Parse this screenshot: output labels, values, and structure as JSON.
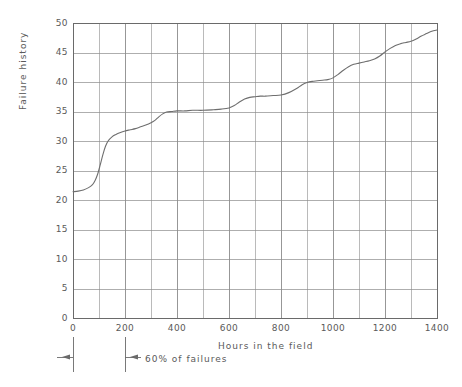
{
  "chart_data": {
    "type": "line",
    "title": "",
    "xlabel": "Hours in the field",
    "ylabel": "Failure history",
    "xlim": [
      0,
      1400
    ],
    "ylim": [
      0,
      50
    ],
    "xticks": [
      0,
      200,
      400,
      600,
      800,
      1000,
      1200,
      1400
    ],
    "yticks": [
      0,
      5,
      10,
      15,
      20,
      25,
      30,
      35,
      40,
      45,
      50
    ],
    "grid": true,
    "minor_grid_x_step": 100,
    "legend": null,
    "series": [
      {
        "name": "Failure history",
        "x": [
          0,
          20,
          40,
          60,
          75,
          85,
          95,
          105,
          115,
          125,
          135,
          150,
          165,
          180,
          200,
          220,
          240,
          260,
          280,
          300,
          315,
          330,
          345,
          360,
          380,
          400,
          430,
          460,
          500,
          540,
          570,
          600,
          620,
          640,
          660,
          680,
          700,
          720,
          740,
          770,
          800,
          830,
          860,
          880,
          900,
          920,
          940,
          960,
          980,
          1000,
          1020,
          1040,
          1060,
          1080,
          1100,
          1120,
          1140,
          1160,
          1180,
          1200,
          1220,
          1240,
          1260,
          1280,
          1300,
          1320,
          1340,
          1360,
          1380,
          1400
        ],
        "y": [
          21.4,
          21.5,
          21.7,
          22.1,
          22.6,
          23.3,
          24.4,
          26.0,
          27.7,
          29.1,
          30.0,
          30.7,
          31.1,
          31.4,
          31.7,
          31.9,
          32.1,
          32.4,
          32.7,
          33.1,
          33.5,
          34.1,
          34.6,
          34.9,
          35.0,
          35.1,
          35.1,
          35.2,
          35.2,
          35.3,
          35.4,
          35.6,
          36.0,
          36.6,
          37.1,
          37.4,
          37.5,
          37.6,
          37.6,
          37.7,
          37.8,
          38.2,
          38.9,
          39.5,
          39.9,
          40.1,
          40.2,
          40.3,
          40.4,
          40.7,
          41.3,
          42.0,
          42.6,
          43.0,
          43.2,
          43.4,
          43.6,
          43.9,
          44.4,
          45.1,
          45.7,
          46.2,
          46.5,
          46.7,
          46.9,
          47.3,
          47.8,
          48.2,
          48.6,
          48.8
        ],
        "color": "#6e6e6e"
      }
    ],
    "annotations": [
      {
        "name": "sixty-percent-of-failures",
        "text": "60% of failures",
        "x_from": 0,
        "x_to": 200,
        "style": "dimension-arrows-below-axis"
      }
    ],
    "colors": {
      "curve": "#6e6e6e",
      "grid": "#8c8c8c",
      "frame": "#6a6a6a",
      "text": "#5a5a5a",
      "background": "#ffffff"
    }
  }
}
